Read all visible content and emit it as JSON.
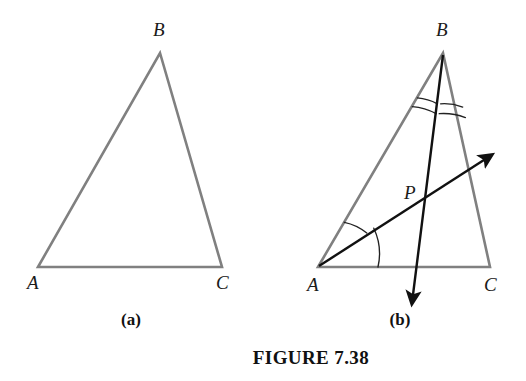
{
  "figure": {
    "caption": "FIGURE 7.38",
    "background_color": "#ffffff",
    "triangle_stroke_color": "#808080",
    "construction_stroke_color": "#111111",
    "arc_stroke_color": "#222222",
    "label_color": "#1a1a1a"
  },
  "panels": [
    {
      "id": "a",
      "label": "(a)",
      "label_position": {
        "x": 131,
        "y": 325
      },
      "vertices": [
        {
          "name": "A",
          "x": 38,
          "y": 267,
          "label": "A",
          "label_x": 27,
          "label_y": 289
        },
        {
          "name": "B",
          "x": 160,
          "y": 53,
          "label": "B",
          "label_x": 153,
          "label_y": 36
        },
        {
          "name": "C",
          "x": 222,
          "y": 267,
          "label": "C",
          "label_x": 216,
          "label_y": 289
        }
      ],
      "edges": [
        {
          "from": "A",
          "to": "B"
        },
        {
          "from": "B",
          "to": "C"
        },
        {
          "from": "C",
          "to": "A"
        }
      ],
      "arcs": [],
      "rays": [],
      "interior_points": []
    },
    {
      "id": "b",
      "label": "(b)",
      "label_position": {
        "x": 400,
        "y": 325
      },
      "vertices": [
        {
          "name": "A",
          "x": 318,
          "y": 267,
          "label": "A",
          "label_x": 307,
          "label_y": 291
        },
        {
          "name": "B",
          "x": 443,
          "y": 53,
          "label": "B",
          "label_x": 436,
          "label_y": 36
        },
        {
          "name": "C",
          "x": 490,
          "y": 267,
          "label": "C",
          "label_x": 484,
          "label_y": 291
        }
      ],
      "edges": [
        {
          "from": "A",
          "to": "B"
        },
        {
          "from": "B",
          "to": "C"
        },
        {
          "from": "C",
          "to": "A"
        }
      ],
      "interior_points": [
        {
          "name": "P",
          "x": 415,
          "y": 204,
          "label": "P",
          "label_x": 404,
          "label_y": 199
        }
      ],
      "rays": [
        {
          "name": "cevian-from-B",
          "from": {
            "x": 443,
            "y": 53
          },
          "to": {
            "x": 412,
            "y": 303
          },
          "arrowhead": "end",
          "description": "angle bisector from B through P, extended below AC"
        },
        {
          "name": "ray-from-A",
          "from": {
            "x": 318,
            "y": 267
          },
          "to": {
            "x": 492,
            "y": 155
          },
          "arrowhead": "end",
          "description": "angle bisector ray from A through P, extended beyond BC"
        }
      ],
      "arcs": [
        {
          "name": "angle-mark-B-left-outer",
          "vertex": "B",
          "radius": 52,
          "count": 1,
          "side": "left"
        },
        {
          "name": "angle-mark-B-left-inner",
          "vertex": "B",
          "radius": 45,
          "count": 1,
          "side": "left"
        },
        {
          "name": "angle-mark-B-right-outer",
          "vertex": "B",
          "radius": 62,
          "count": 1,
          "side": "right"
        },
        {
          "name": "angle-mark-B-right-inner",
          "vertex": "B",
          "radius": 55,
          "count": 1,
          "side": "right"
        },
        {
          "name": "angle-mark-A-upper",
          "vertex": "A",
          "radius": 52,
          "count": 1,
          "side": "upper"
        },
        {
          "name": "angle-mark-A-lower",
          "vertex": "A",
          "radius": 60,
          "count": 1,
          "side": "lower"
        }
      ]
    }
  ],
  "caption_position": {
    "x": 311,
    "y": 364
  }
}
